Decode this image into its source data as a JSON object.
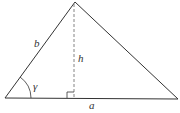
{
  "diagram": {
    "type": "triangle-with-altitude",
    "stroke_color": "#333333",
    "altitude_color": "#666666",
    "labels": {
      "side_b": "b",
      "height": "h",
      "angle_gamma": "γ",
      "side_a": "a"
    },
    "vertices": {
      "left": [
        5,
        98
      ],
      "apex": [
        75,
        2
      ],
      "right": [
        178,
        99
      ]
    },
    "altitude_foot": [
      74,
      98
    ],
    "right_angle_marker": true
  }
}
